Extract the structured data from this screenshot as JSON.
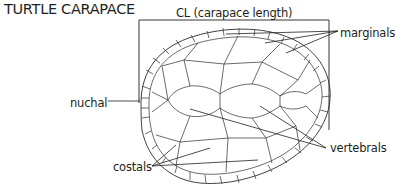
{
  "title": "TURTLE CARAPACE",
  "labels": {
    "cl": "CL (carapace length)",
    "marginals": "marginals",
    "nuchal": "nuchal",
    "costals": "costals",
    "vertebrals": "vertebrals"
  },
  "colors": {
    "ink": "#231f20",
    "background": "#ffffff"
  }
}
